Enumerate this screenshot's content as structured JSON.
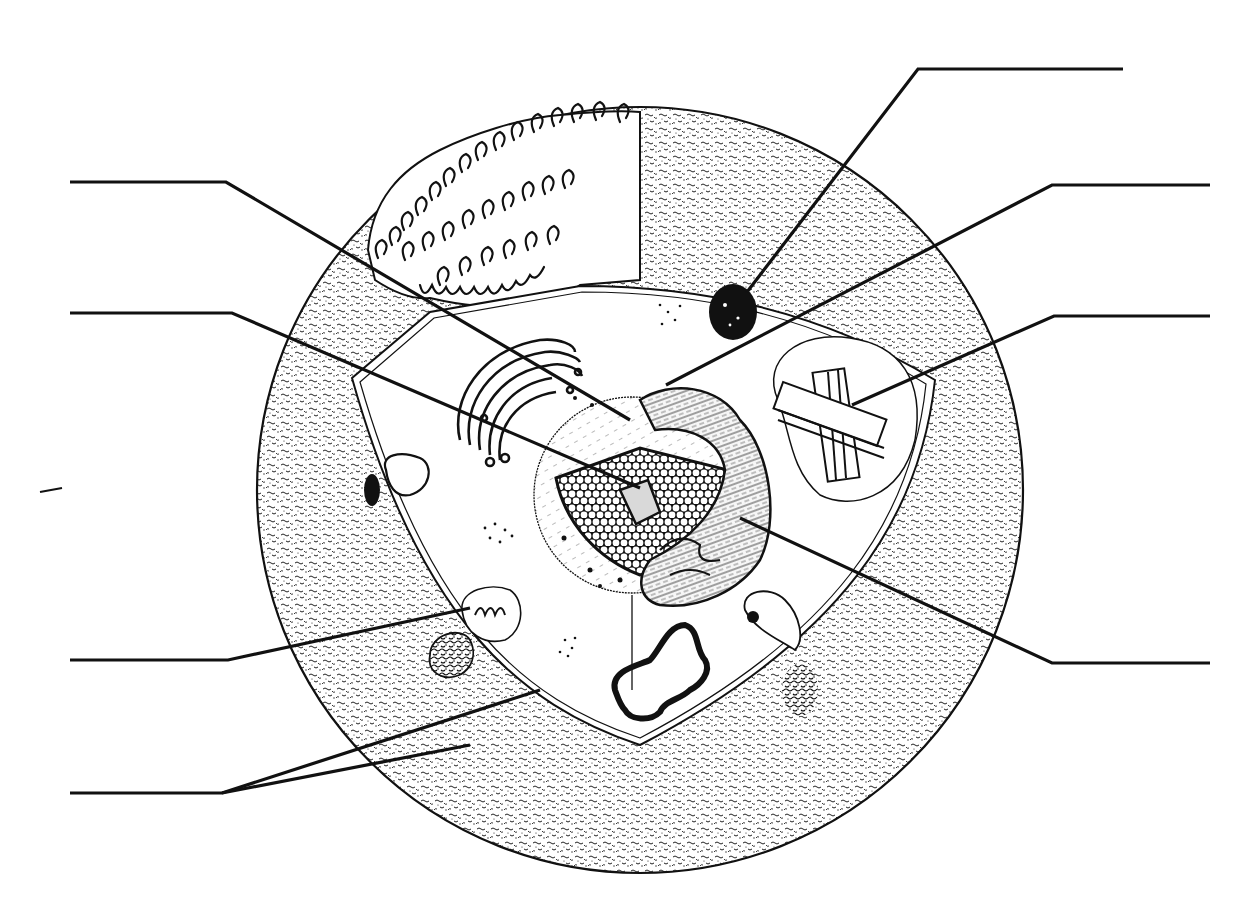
{
  "diagram": {
    "type": "cell-structure-worksheet",
    "labels_visible": false,
    "colors": {
      "ink": "#111111",
      "paper": "#ffffff",
      "stipple": "#2a2a2a"
    },
    "cell": {
      "cx": 640,
      "cy": 490,
      "r": 383
    },
    "leader_lines": [
      {
        "id": "left-1",
        "side": "left",
        "label": "",
        "points": [
          [
            70,
            182
          ],
          [
            226,
            182
          ],
          [
            630,
            420
          ]
        ]
      },
      {
        "id": "left-2",
        "side": "left",
        "label": "",
        "points": [
          [
            70,
            313
          ],
          [
            232,
            313
          ],
          [
            640,
            488
          ]
        ]
      },
      {
        "id": "left-3",
        "side": "left",
        "label": "",
        "points": [
          [
            70,
            660
          ],
          [
            228,
            660
          ],
          [
            470,
            608
          ]
        ]
      },
      {
        "id": "left-4",
        "side": "left",
        "label": "",
        "points": [
          [
            70,
            793
          ],
          [
            222,
            793
          ],
          [
            540,
            690
          ]
        ],
        "fork": [
          [
            222,
            793
          ],
          [
            470,
            745
          ]
        ]
      },
      {
        "id": "right-1",
        "side": "right",
        "label": "",
        "points": [
          [
            1123,
            69
          ],
          [
            918,
            69
          ],
          [
            747,
            292
          ]
        ]
      },
      {
        "id": "right-2",
        "side": "right",
        "label": "",
        "points": [
          [
            1210,
            185
          ],
          [
            1052,
            185
          ],
          [
            666,
            385
          ]
        ]
      },
      {
        "id": "right-3",
        "side": "right",
        "label": "",
        "points": [
          [
            1210,
            316
          ],
          [
            1054,
            316
          ],
          [
            852,
            405
          ]
        ]
      },
      {
        "id": "right-4",
        "side": "right",
        "label": "",
        "points": [
          [
            1210,
            663
          ],
          [
            1052,
            663
          ],
          [
            740,
            518
          ]
        ]
      }
    ],
    "stray_mark": {
      "points": [
        [
          40,
          492
        ],
        [
          62,
          488
        ]
      ]
    }
  }
}
